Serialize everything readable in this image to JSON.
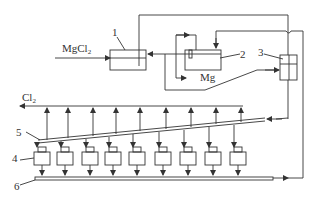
{
  "diagram": {
    "type": "process-flow",
    "labels": {
      "mgcl2_main": "MgCl",
      "mgcl2_sub": "2",
      "cl2_main": "Cl",
      "cl2_sub": "2",
      "mg": "Mg",
      "n1": "1",
      "n2": "2",
      "n3": "3",
      "n4": "4",
      "n5": "5",
      "n6": "6"
    },
    "components": [
      {
        "id": "1",
        "role": "feed unit (MgCl2 input)"
      },
      {
        "id": "2",
        "role": "unit producing Mg"
      },
      {
        "id": "3",
        "role": "distribution unit"
      },
      {
        "id": "4",
        "role": "electrolytic cells (9)"
      },
      {
        "id": "5",
        "role": "inclined collector pipe"
      },
      {
        "id": "6",
        "role": "bottom collector pipe"
      }
    ],
    "cell_count": 9,
    "colors": {
      "line": "#333333",
      "background": "#ffffff"
    }
  }
}
